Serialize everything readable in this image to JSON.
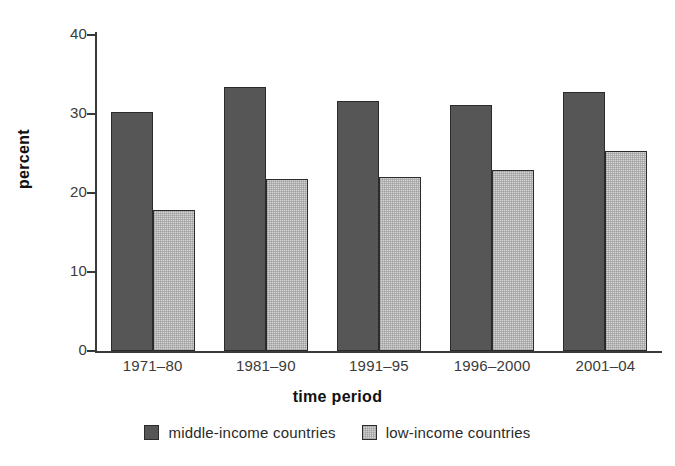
{
  "chart_data": {
    "type": "bar",
    "title": "",
    "xlabel": "time period",
    "ylabel": "percent",
    "categories": [
      "1971–80",
      "1981–90",
      "1991–95",
      "1996–2000",
      "2001–04"
    ],
    "series": [
      {
        "name": "middle-income countries",
        "color": "#565656",
        "values": [
          30.2,
          33.4,
          31.6,
          31.2,
          32.8
        ]
      },
      {
        "name": "low-income countries",
        "color": "#d5d5d5",
        "values": [
          17.8,
          21.8,
          22.0,
          22.9,
          25.3
        ]
      }
    ],
    "ylim": [
      0,
      42
    ],
    "yticks": [
      0,
      10,
      20,
      30,
      40
    ],
    "ytick_labels": [
      "0",
      "10",
      "20",
      "30",
      "40"
    ],
    "grid": false,
    "legend_position": "bottom"
  }
}
